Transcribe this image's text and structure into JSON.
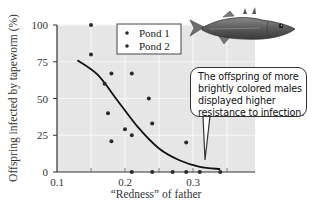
{
  "chart_data": {
    "type": "scatter",
    "title": "",
    "xlabel": "“Redness” of father",
    "ylabel": "Offspring infected by tapeworm (%)",
    "xlim": [
      0.1,
      0.35
    ],
    "ylim": [
      0,
      100
    ],
    "xticks": [
      "0.1",
      "0.2",
      "0.3"
    ],
    "yticks": [
      "0",
      "25",
      "50",
      "75",
      "100"
    ],
    "grid": true,
    "legend": [
      "Pond 1",
      "Pond 2"
    ],
    "legend_position": "upper right",
    "series": [
      {
        "name": "Pond 1",
        "points": [
          [
            0.15,
            100
          ],
          [
            0.15,
            80
          ],
          [
            0.18,
            67
          ],
          [
            0.17,
            60
          ],
          [
            0.21,
            67
          ],
          [
            0.175,
            40
          ],
          [
            0.2,
            29
          ],
          [
            0.21,
            25
          ],
          [
            0.21,
            0
          ],
          [
            0.27,
            0
          ],
          [
            0.31,
            0
          ]
        ]
      },
      {
        "name": "Pond 2",
        "points": [
          [
            0.235,
            50
          ],
          [
            0.24,
            33
          ],
          [
            0.18,
            21
          ],
          [
            0.29,
            20
          ],
          [
            0.24,
            0
          ],
          [
            0.29,
            0
          ],
          [
            0.34,
            0
          ]
        ]
      }
    ],
    "trend_line": {
      "type": "curve",
      "points": [
        [
          0.13,
          76
        ],
        [
          0.16,
          66
        ],
        [
          0.19,
          48
        ],
        [
          0.22,
          30
        ],
        [
          0.25,
          16
        ],
        [
          0.28,
          8
        ],
        [
          0.31,
          3.5
        ],
        [
          0.34,
          2
        ]
      ]
    },
    "annotation": {
      "lines": [
        "The offspring of more",
        "brightly colored males",
        "displayed higher",
        "resistance to infection."
      ],
      "points_to": [
        0.32,
        3
      ]
    }
  },
  "colors": {
    "plot_bg": "#e6e6e6",
    "grid": "#f7f7f7",
    "point": "#2a2a2a",
    "line": "#111111"
  },
  "image": {
    "fish_icon": "stickleback-fish"
  }
}
